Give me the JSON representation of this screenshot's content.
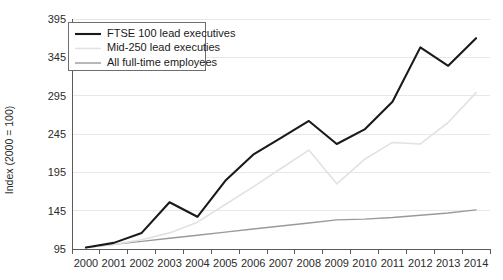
{
  "chart_data": {
    "type": "line",
    "title": "",
    "xlabel": "",
    "ylabel": "Index (2000 = 100)",
    "categories": [
      "2000",
      "2001",
      "2002",
      "2003",
      "2004",
      "2005",
      "2006",
      "2007",
      "2008",
      "2009",
      "2010",
      "2011",
      "2012",
      "2013",
      "2014"
    ],
    "x": [
      2000,
      2001,
      2002,
      2003,
      2004,
      2005,
      2006,
      2007,
      2008,
      2009,
      2010,
      2011,
      2012,
      2013,
      2014
    ],
    "ylim": [
      95,
      395
    ],
    "xlim": [
      2000,
      2014
    ],
    "yticks": [
      95,
      145,
      195,
      245,
      295,
      345,
      395
    ],
    "grid": true,
    "legend_position": "top-left",
    "series": [
      {
        "name": "FTSE 100 lead executives",
        "color": "#1a1a1a",
        "width": 2.1,
        "values": [
          97,
          103,
          116,
          156,
          137,
          184,
          218,
          240,
          262,
          232,
          251,
          287,
          358,
          334,
          370
        ]
      },
      {
        "name": "Mid-250 lead executies",
        "color": "#e2e2e2",
        "width": 1.6,
        "values": [
          97,
          101,
          107,
          116,
          130,
          153,
          176,
          200,
          224,
          180,
          212,
          234,
          232,
          260,
          299
        ]
      },
      {
        "name": "All full-time employees",
        "color": "#9a9a9a",
        "width": 1.4,
        "values": [
          97,
          101,
          105,
          109,
          113,
          117,
          121,
          125,
          129,
          133,
          134,
          136,
          139,
          142,
          146
        ]
      }
    ]
  },
  "legend": {
    "items": [
      {
        "label": "FTSE 100 lead executives"
      },
      {
        "label": "Mid-250 lead executies"
      },
      {
        "label": "All full-time employees"
      }
    ]
  },
  "y_axis": {
    "title": "Index (2000 = 100)",
    "tick_labels": [
      "395",
      "345",
      "295",
      "245",
      "195",
      "145",
      "95"
    ]
  },
  "x_axis": {
    "tick_labels": [
      "2000",
      "2001",
      "2002",
      "2003",
      "2004",
      "2005",
      "2006",
      "2007",
      "2008",
      "2009",
      "2010",
      "2011",
      "2012",
      "2013",
      "2014"
    ]
  }
}
